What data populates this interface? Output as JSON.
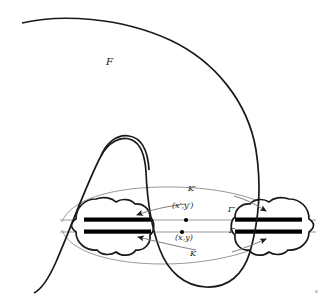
{
  "figure": {
    "background_color": "#ffffff",
    "width": 324,
    "height": 298,
    "labels": {
      "region_F": "F",
      "curve_K_prime": "K′",
      "curve_K": "K",
      "line_gamma_prime": "Γ′",
      "line_gamma": "Γ",
      "point_prime": "(x′,y′)",
      "point": "(x,y)"
    },
    "colors": {
      "curve_stroke": "#1a1a1a",
      "lens_stroke": "#8c8c8c",
      "axis_line": "#9a9a9a",
      "bar_fill": "#000000",
      "label_text": "#1a1a1a"
    },
    "geometry": {
      "axis_prime_y": 220,
      "axis_y": 232,
      "point_prime_x": 186,
      "point_x": 182,
      "left_blob_center_x": 105,
      "right_blob_center_x": 280,
      "blob_center_y": 226
    },
    "elements": [
      {
        "name": "outer-curve-F",
        "kind": "open-curve"
      },
      {
        "name": "inner-hook-loop",
        "kind": "closed-loop"
      },
      {
        "name": "lens-curve-k-prime",
        "kind": "arc"
      },
      {
        "name": "lens-curve-k",
        "kind": "arc"
      },
      {
        "name": "axis-line-gamma-prime",
        "kind": "line"
      },
      {
        "name": "axis-line-gamma",
        "kind": "line"
      },
      {
        "name": "left-cloud-blob",
        "kind": "blob"
      },
      {
        "name": "right-cloud-blob",
        "kind": "blob"
      },
      {
        "name": "thick-bar",
        "count": 4
      },
      {
        "name": "arrow-pointer",
        "count": 4
      },
      {
        "name": "point-marker",
        "count": 2
      }
    ]
  }
}
